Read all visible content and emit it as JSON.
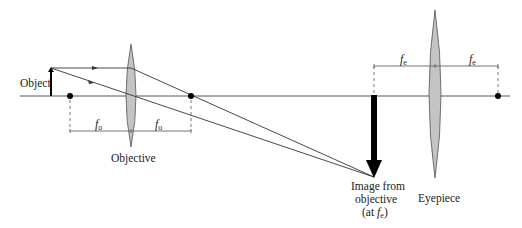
{
  "diagram": {
    "labels": {
      "object": "Object",
      "objective": "Objective",
      "eyepiece": "Eyepiece",
      "image_line1": "Image from",
      "image_line2": "objective",
      "image_line3_prefix": "(at ",
      "image_line3_f": "f",
      "image_line3_sub": "e",
      "image_line3_suffix": ")"
    },
    "focal_labels": {
      "objective_left": {
        "f": "f",
        "sub": "o"
      },
      "objective_right": {
        "f": "f",
        "sub": "o"
      },
      "eyepiece_left": {
        "f": "f",
        "sub": "e"
      },
      "eyepiece_right": {
        "f": "f",
        "sub": "e"
      }
    },
    "colors": {
      "line": "#333333",
      "lens_fill": "#c4c4c4",
      "lens_stroke": "#555555",
      "arrow": "#000000",
      "dashed": "#666666"
    }
  }
}
